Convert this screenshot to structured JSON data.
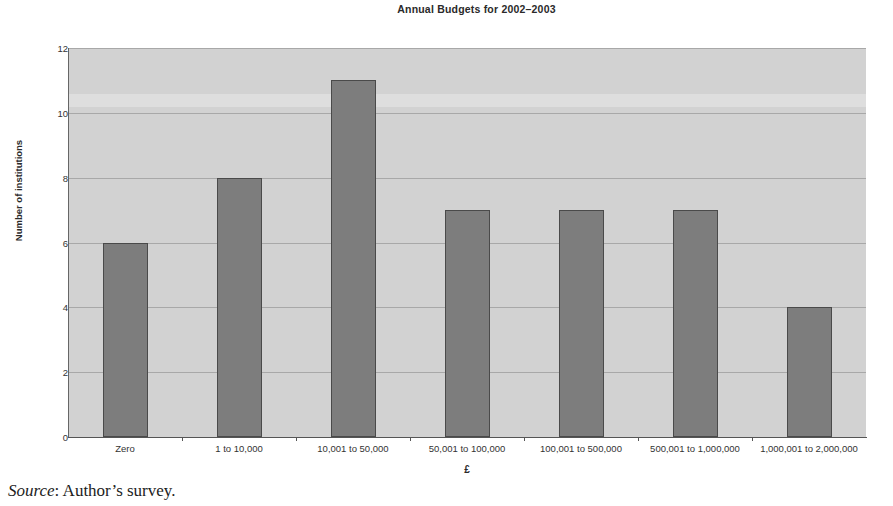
{
  "chart_data": {
    "type": "bar",
    "title": "Annual Budgets for 2002–2003",
    "xlabel": "£",
    "ylabel": "Number of institutions",
    "categories": [
      "Zero",
      "1 to 10,000",
      "10,001 to 50,000",
      "50,001 to 100,000",
      "100,001 to 500,000",
      "500,001 to 1,000,000",
      "1,000,001 to 2,000,000"
    ],
    "values": [
      6,
      8,
      11,
      7,
      7,
      7,
      4
    ],
    "ylim": [
      0,
      12
    ],
    "ytick_labels": [
      "0",
      "2",
      "4",
      "6",
      "8",
      "10",
      "12"
    ],
    "ytick_values": [
      0,
      2,
      4,
      6,
      8,
      10,
      12
    ],
    "grid": true,
    "legend": false,
    "bar_color": "#7d7d7d",
    "bar_edge_color": "#4a4a4a",
    "plot_background": "#d2d2d2",
    "gridline_color": "#a8a8a8"
  },
  "caption": {
    "source_word": "Source",
    "source_text": ": Author’s survey."
  }
}
